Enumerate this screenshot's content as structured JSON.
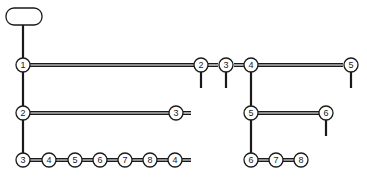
{
  "diagram": {
    "type": "tree",
    "root": {
      "label": ""
    },
    "nodes": [
      {
        "id": "a1",
        "label": "1"
      },
      {
        "id": "a2",
        "label": "2"
      },
      {
        "id": "a3",
        "label": "3"
      },
      {
        "id": "b3",
        "label": "3"
      },
      {
        "id": "c3",
        "label": "3"
      },
      {
        "id": "c4",
        "label": "4"
      },
      {
        "id": "c5",
        "label": "5"
      },
      {
        "id": "c6",
        "label": "6"
      },
      {
        "id": "c7",
        "label": "7"
      },
      {
        "id": "c8",
        "label": "8"
      },
      {
        "id": "c9",
        "label": "4"
      },
      {
        "id": "d2",
        "label": "2"
      },
      {
        "id": "d3",
        "label": "3"
      },
      {
        "id": "d4",
        "label": "4"
      },
      {
        "id": "d5",
        "label": "5"
      },
      {
        "id": "e5",
        "label": "5"
      },
      {
        "id": "e6",
        "label": "6"
      },
      {
        "id": "f6",
        "label": "6"
      },
      {
        "id": "f7",
        "label": "7"
      },
      {
        "id": "f8",
        "label": "8"
      }
    ]
  }
}
